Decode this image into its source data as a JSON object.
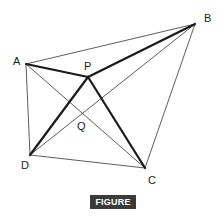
{
  "figure": {
    "caption": "FIGURE 4-6",
    "points": {
      "A": {
        "label": "A",
        "x": 26,
        "y": 64
      },
      "B": {
        "label": "B",
        "x": 195,
        "y": 24
      },
      "P": {
        "label": "P",
        "x": 88,
        "y": 77
      },
      "Q": {
        "label": "Q",
        "x": 81,
        "y": 114
      },
      "C": {
        "label": "C",
        "x": 145,
        "y": 168
      },
      "D": {
        "label": "D",
        "x": 30,
        "y": 155
      }
    },
    "thin_segments": [
      "AB",
      "BC",
      "CD",
      "DA",
      "AC",
      "BD"
    ],
    "thick_segments": [
      "PA",
      "PB",
      "PC",
      "PD"
    ]
  }
}
